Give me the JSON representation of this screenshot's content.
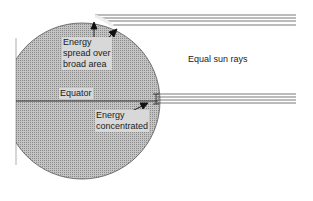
{
  "diagram": {
    "labels": {
      "spread_line1": "Energy",
      "spread_line2": "spread over",
      "spread_line3": "broad area",
      "equal_rays": "Equal sun rays",
      "equator": "Equator",
      "concentrated_line1": "Energy",
      "concentrated_line2": "concentrated"
    },
    "colors": {
      "earth_fill": "#b4b4b4",
      "earth_stroke": "#555555",
      "ray": "#555555",
      "text": "#222222"
    },
    "rays": {
      "top_group_y": [
        15,
        18,
        21,
        25
      ],
      "equator_group_y": [
        94,
        97,
        100,
        103
      ]
    }
  }
}
